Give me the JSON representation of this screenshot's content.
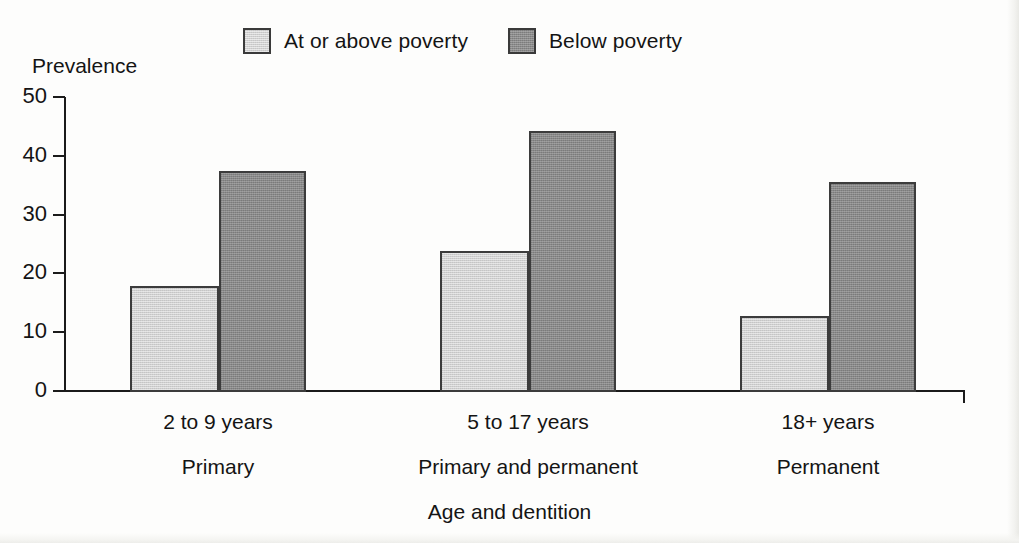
{
  "chart_data": {
    "type": "bar",
    "title": "",
    "xlabel": "Age and dentition",
    "ylabel": "Prevalence",
    "ylim": [
      0,
      50
    ],
    "yticks": [
      0,
      10,
      20,
      30,
      40,
      50
    ],
    "ytick_labels": [
      "0",
      "10",
      "20",
      "30",
      "40",
      "50"
    ],
    "grid": false,
    "legend_position": "top",
    "categories": [
      "2 to 9 years",
      "5 to 17 years",
      "18+ years"
    ],
    "category_sublabels": [
      "Primary",
      "Primary and permanent",
      "Permanent"
    ],
    "series": [
      {
        "name": "At or above poverty",
        "color": "#d0d0d0",
        "values": [
          17.8,
          23.8,
          12.7
        ]
      },
      {
        "name": "Below poverty",
        "color": "#888888",
        "values": [
          37.4,
          44.3,
          35.6
        ]
      }
    ]
  },
  "legend": {
    "items": [
      {
        "label": "At or above poverty",
        "swatch": "light"
      },
      {
        "label": "Below poverty",
        "swatch": "dark"
      }
    ]
  },
  "axes": {
    "y_title": "Prevalence",
    "x_title": "Age and dentition"
  },
  "colors": {
    "series_light": "#d0d0d0",
    "series_dark": "#888888",
    "axis": "#1b1b1b",
    "bar_border": "#3c3c3c",
    "background": "#fdfdfc"
  }
}
